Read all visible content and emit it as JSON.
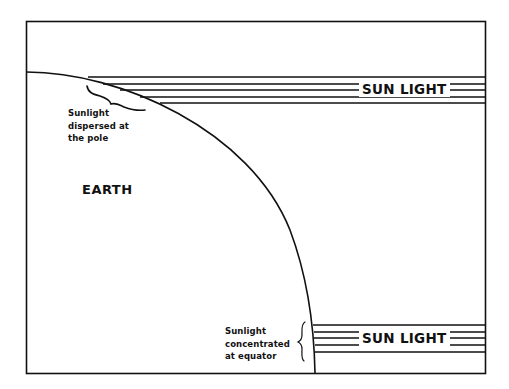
{
  "diagram": {
    "type": "diagram",
    "title": "",
    "colors": {
      "line": "#111111",
      "background": "#ffffff"
    },
    "labels": {
      "earth": "EARTH",
      "sunlight_top": "SUN LIGHT",
      "sunlight_bottom": "SUN LIGHT",
      "pole_note": {
        "line1": "Sunlight",
        "line2": "dispersed at",
        "line3": "the pole"
      },
      "equator_note": {
        "line1": "Sunlight",
        "line2": "concentrated",
        "line3": "at equator"
      }
    },
    "elements": [
      {
        "id": "frame",
        "shape": "rectangle"
      },
      {
        "id": "earth-curve",
        "shape": "quarter-arc"
      },
      {
        "id": "sunlight-band-top",
        "shape": "parallel-lines",
        "count": 5
      },
      {
        "id": "sunlight-band-bottom",
        "shape": "parallel-lines",
        "count": 5
      },
      {
        "id": "brace-pole",
        "shape": "curly-brace"
      },
      {
        "id": "brace-equator",
        "shape": "curly-brace"
      }
    ]
  }
}
